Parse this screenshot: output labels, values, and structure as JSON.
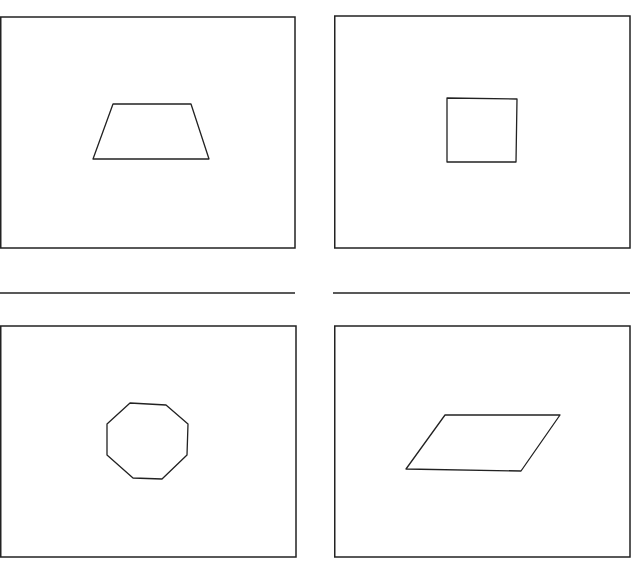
{
  "diagram": {
    "stroke_color": "#222222",
    "background": "#ffffff",
    "panels": [
      {
        "id": "top-left",
        "shape": "trapezoid",
        "frame": {
          "x": 0,
          "y": 17,
          "w": 295,
          "h": 231
        },
        "points": "113,104 191,104 209,159 93,159"
      },
      {
        "id": "top-right",
        "shape": "square",
        "frame": {
          "x": 334,
          "y": 16,
          "w": 296,
          "h": 232
        },
        "points": "447,98 517,99 516,162 447,162"
      },
      {
        "id": "bottom-left",
        "shape": "octagon",
        "frame": {
          "x": 0,
          "y": 326,
          "w": 296,
          "h": 231
        },
        "points": "130,403 166,405 188,424 187,455 162,479 133,478 107,455 107,424"
      },
      {
        "id": "bottom-right",
        "shape": "parallelogram",
        "frame": {
          "x": 334,
          "y": 326,
          "w": 296,
          "h": 231
        },
        "points": "445,415 560,415 521,471 406,469"
      }
    ],
    "dividers": [
      {
        "x1": 0,
        "y1": 293,
        "x2": 295,
        "y2": 293
      },
      {
        "x1": 333,
        "y1": 293,
        "x2": 630,
        "y2": 293
      }
    ]
  }
}
